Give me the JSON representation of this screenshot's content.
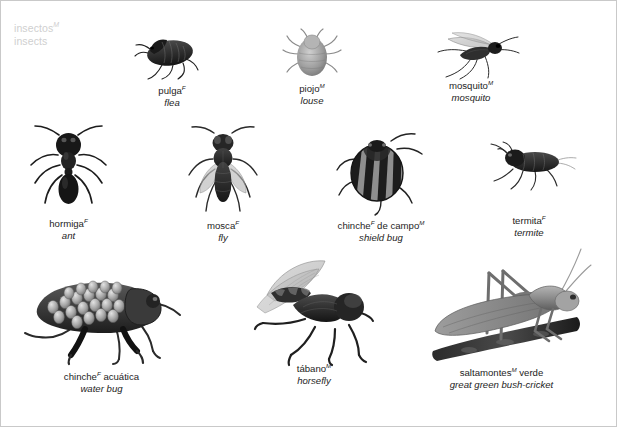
{
  "heading": {
    "spanish": "insectos",
    "spanish_gender": "M",
    "english": "insects"
  },
  "palette": {
    "border": "#c9c9c9",
    "heading_text": "#cfcfcf",
    "caption_text": "#1d1d1d",
    "ink_dark": "#2a2a2a",
    "ink_mid": "#6b6b6b",
    "ink_light": "#a8a8a8",
    "background": "#ffffff"
  },
  "figures": [
    {
      "id": "flea",
      "icon": "flea-illustration",
      "spanish": "pulga",
      "gender": "F",
      "english": "flea"
    },
    {
      "id": "louse",
      "icon": "louse-illustration",
      "spanish": "piojo",
      "gender": "M",
      "english": "louse"
    },
    {
      "id": "mosquito",
      "icon": "mosquito-illustration",
      "spanish": "mosquito",
      "gender": "M",
      "english": "mosquito"
    },
    {
      "id": "ant",
      "icon": "ant-illustration",
      "spanish": "hormiga",
      "gender": "F",
      "english": "ant"
    },
    {
      "id": "fly",
      "icon": "fly-illustration",
      "spanish": "mosca",
      "gender": "F",
      "english": "fly"
    },
    {
      "id": "shield-bug",
      "icon": "shield-bug-illustration",
      "spanish": "chinche",
      "gender": "F",
      "spanish_tail": " de campo",
      "gender2": "M",
      "english": "shield bug"
    },
    {
      "id": "termite",
      "icon": "termite-illustration",
      "spanish": "termita",
      "gender": "F",
      "english": "termite"
    },
    {
      "id": "water-bug",
      "icon": "water-bug-illustration",
      "spanish": "chinche",
      "gender": "F",
      "spanish_tail": " acuática",
      "english": "water bug"
    },
    {
      "id": "horsefly",
      "icon": "horsefly-illustration",
      "spanish": "tábano",
      "gender": "M",
      "english": "horsefly"
    },
    {
      "id": "bush-cricket",
      "icon": "bush-cricket-illustration",
      "spanish": "saltamontes",
      "gender": "M",
      "spanish_tail": " verde",
      "english": "great green bush-cricket"
    }
  ]
}
